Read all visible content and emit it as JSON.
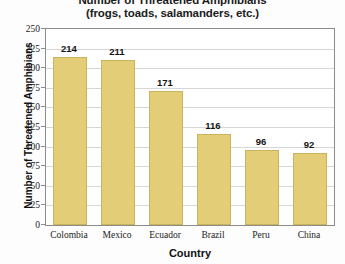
{
  "chart_data": {
    "type": "bar",
    "title": "Number of Threatened Amphibians",
    "subtitle": "(frogs, toads, salamanders, etc.)",
    "xlabel": "Country",
    "ylabel": "Number of Threatened Amphibians",
    "categories": [
      "Colombia",
      "Mexico",
      "Ecuador",
      "Brazil",
      "Peru",
      "China"
    ],
    "values": [
      214,
      211,
      171,
      116,
      96,
      92
    ],
    "value_labels": [
      "214",
      "211",
      "171",
      "116",
      "96",
      "92"
    ],
    "ylim": [
      0,
      250
    ],
    "ytick_step": 25,
    "ytick_labels": [
      "250",
      "225",
      "200",
      "175",
      "150",
      "125",
      "100",
      "75",
      "50",
      "25",
      "0"
    ],
    "ytick_values": [
      250,
      225,
      200,
      175,
      150,
      125,
      100,
      75,
      50,
      25,
      0
    ],
    "grid": true,
    "legend": false,
    "legend_position": "none",
    "colors": {
      "bar_fill": "#e3ce77",
      "bar_border": "#cbb25d",
      "gridline": "#d6d6d6",
      "axis_border": "#8c8c8c",
      "text": "#1a1a1a",
      "plot_background": "#ffffff",
      "canvas_background": "#fdfdfd"
    }
  }
}
